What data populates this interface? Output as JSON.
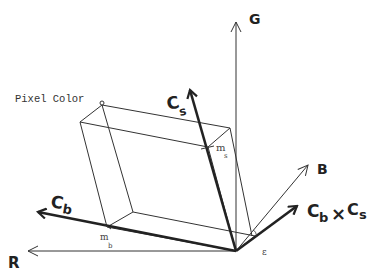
{
  "diagram": {
    "axes": {
      "R": {
        "label": "R"
      },
      "G": {
        "label": "G"
      },
      "B": {
        "label": "B"
      }
    },
    "vectors": {
      "Cs": {
        "label": "C",
        "sub": "s"
      },
      "Cb": {
        "label": "C",
        "sub": "b"
      },
      "cross": {
        "label_a": "C",
        "sub_a": "b",
        "op": "×",
        "label_b": "C",
        "sub_b": "s"
      }
    },
    "points": {
      "pixel_color": {
        "label": "Pixel Color"
      },
      "m_s": {
        "label": "m",
        "sub": "s"
      },
      "m_b": {
        "label": "m",
        "sub": "b"
      },
      "epsilon": {
        "label": "ε"
      }
    },
    "colors": {
      "stroke": "#222222",
      "background": "#ffffff"
    }
  }
}
